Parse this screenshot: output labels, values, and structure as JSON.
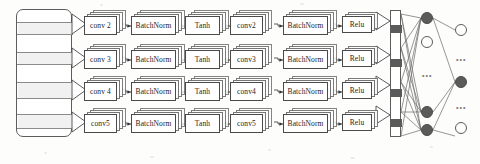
{
  "figure": {
    "background_color": "#fdfdfb",
    "line_color": "#5d5d5d"
  },
  "input_block": {
    "name": "input-feature-block",
    "segments": 7
  },
  "branches": [
    {
      "row": 1,
      "stages": [
        {
          "label": "conv 2",
          "kind": "conv",
          "stacked": true
        },
        {
          "label": "BatchNorm",
          "kind": "norm",
          "stacked": true
        },
        {
          "label": "Tanh",
          "kind": "activation",
          "stacked": true
        },
        {
          "label": "conv2",
          "kind": "conv",
          "stacked": true
        },
        {
          "label": "BatchNorm",
          "kind": "norm",
          "stacked": true
        },
        {
          "label": "Relu",
          "kind": "activation",
          "stacked": true
        }
      ]
    },
    {
      "row": 2,
      "stages": [
        {
          "label": "conv 3",
          "kind": "conv",
          "stacked": true
        },
        {
          "label": "BatchNorm",
          "kind": "norm",
          "stacked": true
        },
        {
          "label": "Tanh",
          "kind": "activation",
          "stacked": true
        },
        {
          "label": "conv3",
          "kind": "conv",
          "stacked": true
        },
        {
          "label": "BatchNorm",
          "kind": "norm",
          "stacked": true
        },
        {
          "label": "Relu",
          "kind": "activation",
          "stacked": true
        }
      ]
    },
    {
      "row": 3,
      "stages": [
        {
          "label": "conv 4",
          "kind": "conv",
          "stacked": true
        },
        {
          "label": "BatchNorm",
          "kind": "norm",
          "stacked": true
        },
        {
          "label": "Tanh",
          "kind": "activation",
          "stacked": true
        },
        {
          "label": "conv4",
          "kind": "conv",
          "stacked": true
        },
        {
          "label": "BatchNorm",
          "kind": "norm",
          "stacked": true
        },
        {
          "label": "Relu",
          "kind": "activation",
          "stacked": true
        }
      ]
    },
    {
      "row": 4,
      "stages": [
        {
          "label": "conv5",
          "kind": "conv",
          "stacked": true
        },
        {
          "label": "BatchNorm",
          "kind": "norm",
          "stacked": true
        },
        {
          "label": "Tanh",
          "kind": "activation",
          "stacked": true
        },
        {
          "label": "conv5",
          "kind": "conv",
          "stacked": true
        },
        {
          "label": "BatchNorm",
          "kind": "norm",
          "stacked": true
        },
        {
          "label": "Relu",
          "kind": "activation",
          "stacked": true
        }
      ]
    }
  ],
  "flatten_bar": {
    "name": "concatenation-bar",
    "filled_segments": 4
  },
  "hidden_layer": {
    "name": "fully-connected-hidden-layer",
    "nodes": [
      {
        "fill": "dark"
      },
      {
        "fill": "light"
      },
      {
        "ellipsis": "•••"
      },
      {
        "fill": "dark"
      },
      {
        "fill": "dark"
      }
    ]
  },
  "output_layer": {
    "name": "output-layer",
    "nodes": [
      {
        "fill": "light"
      },
      {
        "ellipsis": "•••"
      },
      {
        "fill": "dark"
      },
      {
        "ellipsis": "•••"
      },
      {
        "fill": "light"
      }
    ]
  }
}
